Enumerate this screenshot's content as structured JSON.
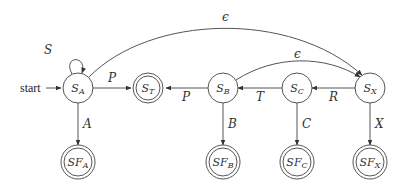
{
  "diagram": {
    "type": "state-machine",
    "start_label": "start",
    "nodes": [
      {
        "id": "SA",
        "base": "S",
        "sub": "A",
        "accepting": false
      },
      {
        "id": "ST",
        "base": "S",
        "sub": "T",
        "accepting": true
      },
      {
        "id": "SB",
        "base": "S",
        "sub": "B",
        "accepting": false
      },
      {
        "id": "SC",
        "base": "S",
        "sub": "C",
        "accepting": false
      },
      {
        "id": "SX",
        "base": "S",
        "sub": "X",
        "accepting": false
      },
      {
        "id": "SFA",
        "base": "SF",
        "sub": "A",
        "accepting": true
      },
      {
        "id": "SFB",
        "base": "SF",
        "sub": "B",
        "accepting": true
      },
      {
        "id": "SFC",
        "base": "SF",
        "sub": "C",
        "accepting": true
      },
      {
        "id": "SFX",
        "base": "SF",
        "sub": "X",
        "accepting": true
      }
    ],
    "edges": [
      {
        "from": "SA",
        "to": "SA",
        "label": "S"
      },
      {
        "from": "SA",
        "to": "ST",
        "label": "P"
      },
      {
        "from": "SA",
        "to": "SX",
        "label": "ϵ"
      },
      {
        "from": "SA",
        "to": "SFA",
        "label": "A"
      },
      {
        "from": "SB",
        "to": "ST",
        "label": "P"
      },
      {
        "from": "SB",
        "to": "SX",
        "label": "ϵ"
      },
      {
        "from": "SB",
        "to": "SFB",
        "label": "B"
      },
      {
        "from": "SC",
        "to": "SB",
        "label": "T"
      },
      {
        "from": "SC",
        "to": "SFC",
        "label": "C"
      },
      {
        "from": "SX",
        "to": "SC",
        "label": "R"
      },
      {
        "from": "SX",
        "to": "SFX",
        "label": "X"
      }
    ]
  }
}
